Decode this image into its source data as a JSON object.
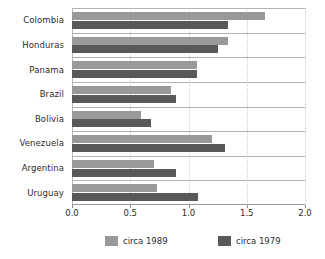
{
  "chart_data": {
    "type": "bar",
    "orientation": "horizontal",
    "title": "",
    "subtitle": "",
    "xlabel": "",
    "ylabel": "",
    "xlim": [
      0.0,
      2.0
    ],
    "xticks": [
      "0.0",
      "0.5",
      "1.0",
      "1.5",
      "2.0"
    ],
    "xtick_values": [
      0.0,
      0.5,
      1.0,
      1.5,
      2.0
    ],
    "grid": "vertical-dotted-and-horizontal-separators",
    "legend_position": "bottom",
    "categories": [
      "Colombia",
      "Honduras",
      "Panama",
      "Brazil",
      "Bolivia",
      "Venezuela",
      "Argentina",
      "Uruguay"
    ],
    "series": [
      {
        "name": "circa 1989",
        "color": "#999999",
        "values": [
          1.66,
          1.34,
          1.07,
          0.85,
          0.59,
          1.2,
          0.7,
          0.73
        ]
      },
      {
        "name": "circa 1979",
        "color": "#595959",
        "values": [
          1.34,
          1.25,
          1.07,
          0.89,
          0.68,
          1.31,
          0.89,
          1.08
        ]
      }
    ]
  },
  "legend": {
    "items": [
      {
        "label": "circa 1989",
        "color": "#999999"
      },
      {
        "label": "circa 1979",
        "color": "#595959"
      }
    ]
  },
  "colors": {
    "series_1989": "#999999",
    "series_1979": "#595959",
    "axis": "#9a9a9a",
    "gridline": "#cfcfcf",
    "separator": "#b3b3b3",
    "text": "#2b2b2b",
    "background": "#ffffff"
  }
}
